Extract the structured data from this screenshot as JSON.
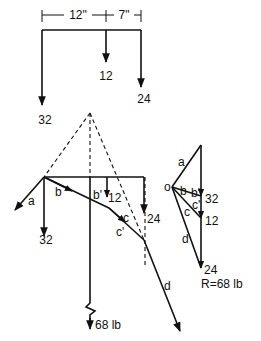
{
  "beam_diagram": {
    "dimensions": [
      {
        "label": "12\""
      },
      {
        "label": "7\""
      }
    ],
    "loads": [
      {
        "label": "32"
      },
      {
        "label": "12"
      },
      {
        "label": "24"
      }
    ]
  },
  "funicular_polygon": {
    "ray_labels": {
      "a": "a",
      "b": "b",
      "b_prime": "b'",
      "c": "c",
      "c_prime": "c'",
      "d": "d"
    },
    "load_labels": {
      "load1": "32",
      "load2": "12",
      "load3": "24"
    },
    "resultant_label": "68 lb"
  },
  "force_polygon": {
    "pole_label": "o",
    "ray_labels": {
      "a": "a",
      "b": "b",
      "b_prime": "b'",
      "c": "c",
      "c_prime": "c'",
      "d": "d"
    },
    "load_labels": {
      "load1": "32",
      "load2": "12",
      "load3": "24"
    },
    "resultant": "R=68 lb"
  }
}
